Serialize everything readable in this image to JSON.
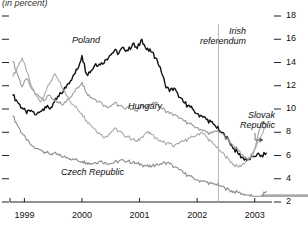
{
  "chart": {
    "subtitle": "(in percent)",
    "annotation": {
      "line1": "Irish",
      "line2": "referendum",
      "x_value": 2002.37
    }
  },
  "chart_data": {
    "type": "line",
    "title": "",
    "subtitle": "(in percent)",
    "xlabel": "",
    "ylabel": "(in percent)",
    "xlim": [
      1998.75,
      2003.3
    ],
    "ylim": [
      2,
      18
    ],
    "grid": false,
    "legend_position": "inline-labels",
    "xticks": [
      1999,
      2000,
      2001,
      2002,
      2003
    ],
    "xtick_labels": [
      "1999",
      "2000",
      "2001",
      "2002",
      "2003"
    ],
    "yticks": [
      2,
      4,
      6,
      8,
      10,
      12,
      14,
      16,
      18
    ],
    "ytick_labels": [
      "2",
      "4",
      "6",
      "8",
      "10",
      "12",
      "14",
      "16",
      "18"
    ],
    "y_axis_side": "right",
    "annotations": [
      {
        "text": "Irish referendum",
        "type": "vline",
        "x": 2002.37
      }
    ],
    "series": [
      {
        "name": "Poland",
        "color": "#111111",
        "width": 1.4,
        "x": [
          1998.8,
          1998.88,
          1998.96,
          1999.04,
          1999.12,
          1999.2,
          1999.28,
          1999.36,
          1999.44,
          1999.52,
          1999.6,
          1999.68,
          1999.76,
          1999.84,
          1999.92,
          2000.0,
          2000.08,
          2000.16,
          2000.24,
          2000.32,
          2000.4,
          2000.48,
          2000.56,
          2000.64,
          2000.72,
          2000.8,
          2000.88,
          2000.96,
          2001.04,
          2001.12,
          2001.2,
          2001.28,
          2001.36,
          2001.44,
          2001.52,
          2001.6,
          2001.68,
          2001.76,
          2001.84,
          2001.92,
          2002.0,
          2002.08,
          2002.16,
          2002.24,
          2002.32,
          2002.4,
          2002.48,
          2002.56,
          2002.64,
          2002.72,
          2002.8,
          2002.88,
          2002.96,
          2003.04,
          2003.12,
          2003.2
        ],
        "y": [
          11.2,
          10.6,
          10.1,
          9.6,
          9.9,
          9.5,
          9.8,
          10.2,
          10.0,
          10.6,
          11.1,
          11.6,
          12.2,
          12.8,
          13.4,
          14.6,
          13.0,
          13.3,
          13.9,
          13.8,
          14.2,
          14.6,
          15.0,
          14.8,
          15.3,
          15.0,
          15.6,
          15.2,
          16.0,
          15.1,
          14.9,
          14.4,
          13.6,
          12.2,
          11.5,
          11.8,
          11.0,
          10.6,
          10.3,
          10.0,
          9.6,
          9.4,
          9.1,
          8.9,
          8.5,
          8.1,
          7.7,
          7.2,
          6.6,
          6.1,
          5.8,
          5.6,
          5.9,
          6.1,
          6.0,
          6.2
        ]
      },
      {
        "name": "Hungary",
        "color": "#9a9a9a",
        "width": 1.1,
        "x": [
          1998.8,
          1998.88,
          1998.96,
          1999.04,
          1999.12,
          1999.2,
          1999.28,
          1999.36,
          1999.44,
          1999.52,
          1999.6,
          1999.68,
          1999.76,
          1999.84,
          1999.92,
          2000.0,
          2000.08,
          2000.16,
          2000.24,
          2000.32,
          2000.4,
          2000.48,
          2000.56,
          2000.64,
          2000.72,
          2000.8,
          2000.88,
          2000.96,
          2001.04,
          2001.12,
          2001.2,
          2001.28,
          2001.36,
          2001.44,
          2001.52,
          2001.6,
          2001.68,
          2001.76,
          2001.84,
          2001.92,
          2002.0,
          2002.08,
          2002.16,
          2002.24,
          2002.32,
          2002.4,
          2002.48,
          2002.56,
          2002.64,
          2002.72,
          2002.8,
          2002.88,
          2002.96,
          2003.04,
          2003.12,
          2003.2
        ],
        "y": [
          14.1,
          13.0,
          11.9,
          12.6,
          11.8,
          11.3,
          11.0,
          10.8,
          11.2,
          10.7,
          10.5,
          10.4,
          10.9,
          11.3,
          11.8,
          12.3,
          11.4,
          11.0,
          10.8,
          10.6,
          10.3,
          10.2,
          10.5,
          10.3,
          10.1,
          10.2,
          10.0,
          9.8,
          10.4,
          10.1,
          10.3,
          10.6,
          10.2,
          9.9,
          9.6,
          9.5,
          9.2,
          9.0,
          8.8,
          8.6,
          8.4,
          8.2,
          8.0,
          7.9,
          8.1,
          8.0,
          7.6,
          7.2,
          6.8,
          6.4,
          6.0,
          5.7,
          5.9,
          7.4,
          8.9,
          8.7
        ]
      },
      {
        "name": "Czech Republic",
        "color": "#8c8c8c",
        "width": 1.1,
        "x": [
          1998.8,
          1998.88,
          1998.96,
          1999.04,
          1999.12,
          1999.2,
          1999.28,
          1999.36,
          1999.44,
          1999.52,
          1999.6,
          1999.68,
          1999.76,
          1999.84,
          1999.92,
          2000.0,
          2000.08,
          2000.16,
          2000.24,
          2000.32,
          2000.4,
          2000.48,
          2000.56,
          2000.64,
          2000.72,
          2000.8,
          2000.88,
          2000.96,
          2001.04,
          2001.12,
          2001.2,
          2001.28,
          2001.36,
          2001.44,
          2001.52,
          2001.6,
          2001.68,
          2001.76,
          2001.84,
          2001.92,
          2002.0,
          2002.08,
          2002.16,
          2002.24,
          2002.32,
          2002.4,
          2002.48,
          2002.56,
          2002.64,
          2002.72,
          2002.8,
          2002.88,
          2002.96,
          3003.04,
          2003.12,
          2003.2
        ],
        "y": [
          9.4,
          8.6,
          7.9,
          7.3,
          6.9,
          6.6,
          6.5,
          6.3,
          6.1,
          6.2,
          6.0,
          5.9,
          5.8,
          5.7,
          5.6,
          5.5,
          5.4,
          5.3,
          5.4,
          5.5,
          5.4,
          5.3,
          5.4,
          5.5,
          5.6,
          5.5,
          5.4,
          5.3,
          5.2,
          5.1,
          5.0,
          5.2,
          5.3,
          5.4,
          5.3,
          5.0,
          4.8,
          4.5,
          4.3,
          4.1,
          3.9,
          3.8,
          3.7,
          3.6,
          3.5,
          3.4,
          3.2,
          3.0,
          2.9,
          2.8,
          2.7,
          2.6,
          2.5,
          2.4,
          2.6,
          2.9
        ]
      },
      {
        "name": "Slovak Republic",
        "color": "#aaaaaa",
        "width": 1.1,
        "x": [
          1998.8,
          1998.88,
          1998.96,
          1999.04,
          1999.12,
          1999.2,
          1999.28,
          1999.36,
          1999.44,
          1999.52,
          1999.6,
          1999.68,
          1999.76,
          1999.84,
          1999.92,
          2000.0,
          2000.08,
          2000.16,
          2000.24,
          2000.32,
          2000.4,
          2000.48,
          2000.56,
          2000.64,
          2000.72,
          2000.8,
          2000.88,
          2000.96,
          2001.04,
          2001.12,
          2001.2,
          2001.28,
          2001.36,
          2001.44,
          2001.52,
          2001.6,
          2001.68,
          2001.76,
          2001.84,
          2001.92,
          2002.0,
          2002.08,
          2002.16,
          2002.24,
          2002.32,
          2002.4,
          2002.48,
          2002.56,
          2002.64,
          2002.72,
          2002.8,
          2002.88,
          2002.96,
          2003.04,
          2003.12,
          2003.2
        ],
        "y": [
          12.8,
          13.6,
          14.4,
          13.2,
          12.0,
          11.2,
          10.6,
          11.4,
          12.2,
          13.0,
          12.4,
          11.6,
          11.0,
          10.4,
          10.0,
          9.6,
          9.0,
          8.6,
          8.2,
          7.8,
          7.6,
          7.9,
          8.3,
          8.1,
          7.8,
          7.6,
          7.4,
          7.2,
          7.6,
          8.0,
          7.8,
          7.5,
          7.3,
          7.1,
          7.0,
          6.8,
          7.0,
          7.2,
          7.4,
          7.6,
          7.8,
          8.0,
          7.6,
          7.2,
          6.8,
          6.4,
          6.0,
          5.6,
          5.2,
          5.0,
          5.3,
          5.6,
          6.2,
          7.0,
          7.8,
          8.6
        ]
      }
    ]
  },
  "labels": {
    "poland": "Poland",
    "hungary": "Hungary",
    "czech": "Czech Republic",
    "slovak_line1": "Slovak",
    "slovak_line2": "Republic"
  }
}
